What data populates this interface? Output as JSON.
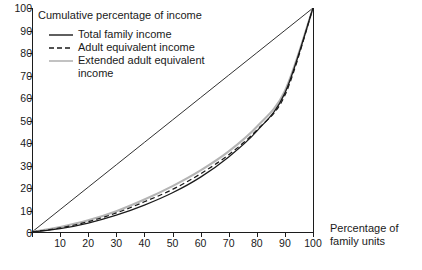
{
  "chart_data": {
    "type": "line",
    "title": "Cumulative percentage of income",
    "xlabel_line1": "Percentage of",
    "xlabel_line2": "family units",
    "ylabel": "Cumulative percentage of income",
    "xlim": [
      0,
      100
    ],
    "ylim": [
      0,
      100
    ],
    "grid": false,
    "legend_position": "inside-top-left",
    "x_ticks": [
      0,
      10,
      20,
      30,
      40,
      50,
      60,
      70,
      80,
      90,
      100
    ],
    "x_tick_labels": [
      "",
      "10",
      "20",
      "30",
      "40",
      "50",
      "60",
      "70",
      "80",
      "90",
      "100"
    ],
    "y_ticks": [
      0,
      10,
      20,
      30,
      40,
      50,
      60,
      70,
      80,
      90,
      100
    ],
    "y_tick_labels": [
      "0",
      "10",
      "20",
      "30",
      "40",
      "50",
      "60",
      "70",
      "80",
      "90",
      "100"
    ],
    "x": [
      0,
      10,
      20,
      30,
      40,
      50,
      60,
      70,
      80,
      90,
      100
    ],
    "series": [
      {
        "name": "Total family income",
        "style": "solid",
        "color": "#1a1a1a",
        "values": [
          0,
          1.5,
          4,
          7.5,
          12,
          17.5,
          24.5,
          33.5,
          45,
          62,
          100
        ]
      },
      {
        "name": "Adult equivalent income",
        "style": "dashed",
        "color": "#1a1a1a",
        "values": [
          0,
          1.8,
          4.6,
          8.5,
          13.5,
          19,
          26,
          34.5,
          45.5,
          61,
          100
        ]
      },
      {
        "name": "Extended adult equivalent income",
        "style": "solid-grey",
        "color": "#b4b4b4",
        "values": [
          0,
          2.2,
          5.2,
          9.3,
          14.5,
          20.5,
          27.5,
          36,
          47,
          63,
          100
        ]
      },
      {
        "name": "Line of equality",
        "style": "solid-thin",
        "color": "#1a1a1a",
        "values": [
          0,
          10,
          20,
          30,
          40,
          50,
          60,
          70,
          80,
          90,
          100
        ]
      }
    ],
    "legend_entries": [
      "Total family income",
      "Adult equivalent income",
      "Extended adult equivalent"
    ],
    "legend_entry_continuation": "income"
  }
}
